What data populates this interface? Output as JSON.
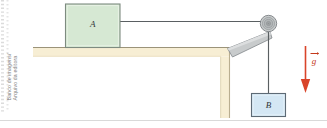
{
  "figure": {
    "credit": {
      "line1": "Banco de imagens/",
      "line2": "Arquivo da editora"
    },
    "background_color": "#ffffff"
  },
  "blocks": [
    {
      "id": "block-a",
      "label": "A",
      "fill": "#d6e8d3",
      "stroke": "#7e8b80",
      "position": "on table surface"
    },
    {
      "id": "block-b",
      "label": "B",
      "fill": "#d4e7f4",
      "stroke": "#5d6a75",
      "position": "hanging from rope"
    }
  ],
  "table": {
    "surface_fill": "#f7eed4",
    "stroke": "#b5a580",
    "leg_fill": "#f7eed4"
  },
  "pulley": {
    "name": "pulley-wheel",
    "hub_fill": "#b9bcbd",
    "rim_fill": "#c9cccd",
    "stroke": "#7d8184",
    "bracket_fill": "#c8cbcc",
    "bracket_stroke": "#7d8184"
  },
  "rope": {
    "name": "rope",
    "color": "#5a5f62"
  },
  "gravity_vector": {
    "label": "g",
    "arrow_color": "#d9442a",
    "direction": "down",
    "description": "acceleration due to gravity vector"
  },
  "edge_marks": {
    "left_strip_color": "#dcdcdc",
    "bottom_rule_color": "#d9d9d9"
  }
}
